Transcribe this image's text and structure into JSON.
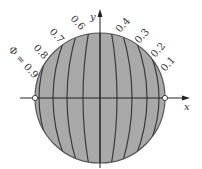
{
  "diagram": {
    "axes": {
      "x_label": "x",
      "y_label": "y"
    },
    "potential_symbol": "Φ = 0.9",
    "contour_labels": [
      "0.8",
      "0.7",
      "0.6",
      "0.4",
      "0.3",
      "0.2",
      "0.1"
    ],
    "colors": {
      "disk_fill": "#a9a9a9",
      "lines": "#3a3a3a",
      "axes": "#222222",
      "markers": "#ffffff"
    },
    "electrodes": [
      {
        "name": "left-point",
        "x": -1,
        "y": 0
      },
      {
        "name": "right-point",
        "x": 1,
        "y": 0
      }
    ],
    "contours": [
      0.1,
      0.2,
      0.3,
      0.4,
      0.5,
      0.6,
      0.7,
      0.8,
      0.9
    ]
  }
}
